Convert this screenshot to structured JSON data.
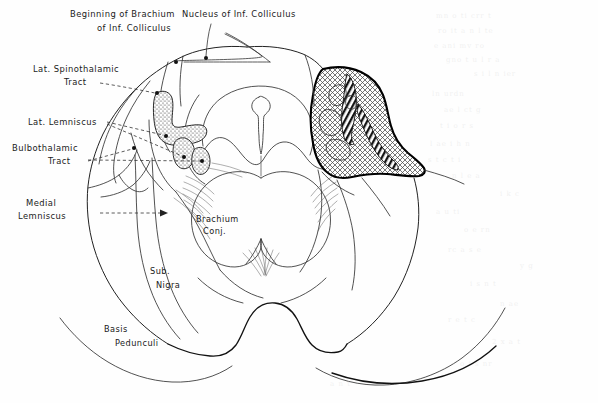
{
  "figure": {
    "background_color": "#fefefe",
    "ink_color": "#111111"
  },
  "labels": {
    "brachium_inf_colliculus": {
      "line1": "Beginning of Brachium",
      "line2": "of Inf. Colliculus"
    },
    "nucleus_inf_colliculus": {
      "line1": "Nucleus of Inf. Colliculus"
    },
    "lat_spinothalamic": {
      "line1": "Lat. Spinothalamic",
      "line2": "Tract"
    },
    "lat_lemniscus": {
      "line1": "Lat. Lemniscus"
    },
    "bulbothalamic": {
      "line1": "Bulbothalamic",
      "line2": "Tract"
    },
    "medial_lemniscus": {
      "line1": "Medial",
      "line2": "Lemniscus"
    },
    "brachium_conj": {
      "line1": "Brachium",
      "line2": "Conj."
    },
    "sub_nigra": {
      "line1": "Sub.",
      "line2": "Nigra"
    },
    "basis_pedunculi": {
      "line1": "Basis",
      "line2": "Pedunculi"
    }
  },
  "regions": [
    {
      "name": "lesion-crosshatch",
      "fill_style": "cross-hatch",
      "outline_color": "#000000"
    },
    {
      "name": "lat-spinothalamic-stipple",
      "fill_style": "stipple"
    },
    {
      "name": "lat-lemniscus-stipple",
      "fill_style": "stipple"
    },
    {
      "name": "bulbothalamic-stipple",
      "fill_style": "stipple"
    }
  ]
}
